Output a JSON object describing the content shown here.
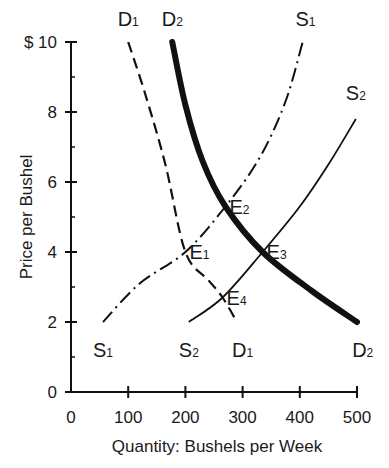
{
  "chart_data": {
    "type": "line",
    "title": "",
    "xlabel": "Quantity: Bushels per Week",
    "ylabel": "Price per Bushel",
    "xlim": [
      0,
      500
    ],
    "ylim": [
      0,
      10
    ],
    "x_ticks": [
      0,
      100,
      200,
      300,
      400,
      500
    ],
    "x_tick_labels": [
      "0",
      "100",
      "200",
      "300",
      "400",
      "500"
    ],
    "y_ticks": [
      0,
      2,
      4,
      6,
      8,
      10
    ],
    "y_tick_labels": [
      "0",
      "2",
      "4",
      "6",
      "8",
      "$ 10"
    ],
    "y_minor_ticks": [
      1,
      3,
      5,
      7,
      9
    ],
    "grid": false,
    "legend": "none (curves labeled directly at ends)",
    "series": [
      {
        "name": "D1",
        "label_main": "D",
        "label_sub": "1",
        "style": "dashed",
        "width": 2.2,
        "points": [
          [
            100,
            10
          ],
          [
            130,
            8.5
          ],
          [
            165,
            6.5
          ],
          [
            200,
            4.0
          ],
          [
            240,
            3.2
          ],
          [
            265,
            2.7
          ],
          [
            290,
            2.0
          ]
        ],
        "label_top": [
          100,
          10.4
        ],
        "label_bottom": [
          300,
          1.4
        ]
      },
      {
        "name": "D2",
        "label_main": "D",
        "label_sub": "2",
        "style": "thick-solid",
        "width": 6,
        "points": [
          [
            177,
            10
          ],
          [
            200,
            8.2
          ],
          [
            230,
            6.6
          ],
          [
            270,
            5.3
          ],
          [
            335,
            4.0
          ],
          [
            420,
            2.9
          ],
          [
            500,
            2.0
          ]
        ],
        "label_top": [
          177,
          10.4
        ],
        "label_bottom": [
          510,
          1.4
        ]
      },
      {
        "name": "S1",
        "label_main": "S",
        "label_sub": "1",
        "style": "dash-dot",
        "width": 2,
        "points": [
          [
            56,
            2.0
          ],
          [
            120,
            3.1
          ],
          [
            200,
            4.0
          ],
          [
            270,
            5.3
          ],
          [
            330,
            6.7
          ],
          [
            375,
            8.3
          ],
          [
            405,
            10.0
          ]
        ],
        "label_top": [
          410,
          10.4
        ],
        "label_bottom": [
          56,
          1.4
        ]
      },
      {
        "name": "S2",
        "label_main": "S",
        "label_sub": "2",
        "style": "solid",
        "width": 1.8,
        "points": [
          [
            206,
            2.0
          ],
          [
            265,
            2.7
          ],
          [
            335,
            4.0
          ],
          [
            400,
            5.3
          ],
          [
            450,
            6.5
          ],
          [
            498,
            7.8
          ]
        ],
        "label_top": [
          498,
          8.3
        ],
        "label_bottom": [
          206,
          1.4
        ]
      }
    ],
    "annotations": [
      {
        "name": "E1",
        "main": "E",
        "sub": "1",
        "point": [
          200,
          4.0
        ]
      },
      {
        "name": "E2",
        "main": "E",
        "sub": "2",
        "point": [
          270,
          5.3
        ]
      },
      {
        "name": "E3",
        "main": "E",
        "sub": "3",
        "point": [
          335,
          4.0
        ]
      },
      {
        "name": "E4",
        "main": "E",
        "sub": "4",
        "point": [
          265,
          2.7
        ]
      }
    ]
  }
}
